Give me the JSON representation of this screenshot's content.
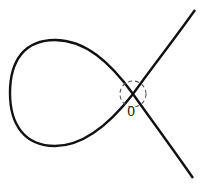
{
  "diagram": {
    "type": "nodal cubic curve (loop with self-intersection)",
    "node_label": "0",
    "colors": {
      "curve": "#111111",
      "circle": "#555555",
      "background": "#ffffff"
    }
  }
}
